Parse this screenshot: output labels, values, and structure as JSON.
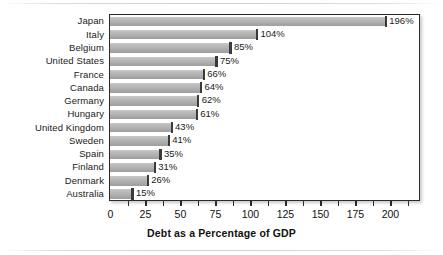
{
  "chart_data": {
    "type": "bar",
    "orientation": "horizontal",
    "title": "",
    "xlabel": "Debt as a Percentage of GDP",
    "ylabel": "",
    "categories": [
      "Japan",
      "Italy",
      "Belgium",
      "United States",
      "France",
      "Canada",
      "Germany",
      "Hungary",
      "United Kingdom",
      "Sweden",
      "Spain",
      "Finland",
      "Denmark",
      "Australia"
    ],
    "values": [
      196,
      104,
      85,
      75,
      66,
      64,
      62,
      61,
      43,
      41,
      35,
      31,
      26,
      15
    ],
    "value_labels": [
      "196%",
      "104%",
      "85%",
      "75%",
      "66%",
      "64%",
      "62%",
      "61%",
      "43%",
      "41%",
      "35%",
      "31%",
      "26%",
      "15%"
    ],
    "xlim": [
      0,
      220
    ],
    "xticks": [
      0,
      25,
      50,
      75,
      100,
      125,
      150,
      175,
      200
    ],
    "xtick_labels": [
      "0",
      "25",
      "50",
      "75",
      "100",
      "125",
      "150",
      "175",
      "200"
    ],
    "xminor_ticks": [
      12.5,
      25,
      37.5,
      50,
      62.5,
      75,
      87.5,
      100,
      112.5,
      125,
      137.5,
      150,
      162.5,
      175,
      187.5,
      200,
      212.5
    ],
    "grid": false,
    "legend": null,
    "bar_color": "#b4b4b4",
    "bar_edge_color": "#3a3a3a",
    "axis_color": "#2b2b2b",
    "background": "#ffffff"
  }
}
